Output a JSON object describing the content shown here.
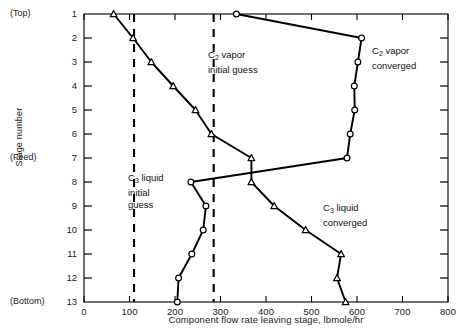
{
  "chart_data": {
    "type": "line",
    "title": "",
    "xlabel": "Component flow rate leaving stage, lbmole/hr",
    "ylabel": "Stage number",
    "xlim": [
      0,
      800
    ],
    "ylim": [
      1,
      13
    ],
    "grid": false,
    "legend": "none (inline annotations)",
    "xticks": [
      "0",
      "100",
      "200",
      "300",
      "400",
      "500",
      "600",
      "700",
      "800"
    ],
    "yticks": [
      "1",
      "2",
      "3",
      "4",
      "5",
      "6",
      "7",
      "8",
      "9",
      "10",
      "11",
      "12",
      "13"
    ],
    "y_edge_labels": [
      {
        "stage": 1,
        "text": "(Top)"
      },
      {
        "stage": 7,
        "text": "(Feed)"
      },
      {
        "stage": 13,
        "text": "(Bottom)"
      }
    ],
    "series": [
      {
        "name": "C2 vapor converged",
        "style": "solid",
        "marker": "circle-open",
        "stages": [
          1,
          2,
          3,
          4,
          5,
          6,
          7,
          8,
          9,
          10,
          11,
          12,
          13
        ],
        "values": [
          335,
          610,
          602,
          594,
          595,
          585,
          578,
          235,
          268,
          262,
          237,
          208,
          205
        ]
      },
      {
        "name": "C3 liquid converged",
        "style": "solid",
        "marker": "triangle-open",
        "stages": [
          1,
          2,
          3,
          4,
          5,
          6,
          7,
          8,
          9,
          10,
          11,
          12,
          13
        ],
        "values": [
          65,
          108,
          148,
          196,
          245,
          280,
          368,
          368,
          418,
          487,
          565,
          556,
          575
        ]
      },
      {
        "name": "C2 vapor initial guess",
        "style": "dashed",
        "marker": "none",
        "constant_value": 285
      },
      {
        "name": "C3 liquid initial guess",
        "style": "dashed",
        "marker": "none",
        "constant_value": 110
      }
    ],
    "annotations": [
      {
        "id": "c2-vapor-initial",
        "line1": "C2 vapor",
        "line2": "initial guess",
        "sub": "2"
      },
      {
        "id": "c2-vapor-converged",
        "line1": "C2 vapor",
        "line2": "converged",
        "sub": "2"
      },
      {
        "id": "c3-liquid-initial",
        "line1": "C3 liquid",
        "line2": "initial",
        "line3": "guess",
        "sub": "3"
      },
      {
        "id": "c3-liquid-converged",
        "line1": "C3 liquid",
        "line2": "converged",
        "sub": "3"
      }
    ]
  },
  "labels": {
    "xaxis_title": "Component flow rate leaving stage, lbmole/hr",
    "yaxis_title": "Stage number",
    "top": "(Top)",
    "feed": "(Feed)",
    "bottom": "(Bottom)"
  },
  "annotations": {
    "c2_initial": {
      "species": "C",
      "sub": "2",
      "rest": " vapor",
      "line2": "initial guess"
    },
    "c2_converged": {
      "species": "C",
      "sub": "2",
      "rest": " vapor",
      "line2": "converged"
    },
    "c3_initial": {
      "species": "C",
      "sub": "3",
      "rest": " liquid",
      "line2": "initial",
      "line3": "guess"
    },
    "c3_converged": {
      "species": "C",
      "sub": "3",
      "rest": " liquid",
      "line2": "converged"
    }
  },
  "colors": {
    "axis": "#000000",
    "curve": "#000000",
    "dashed": "#000000",
    "text": "#1a1a1a",
    "background": "#ffffff"
  }
}
